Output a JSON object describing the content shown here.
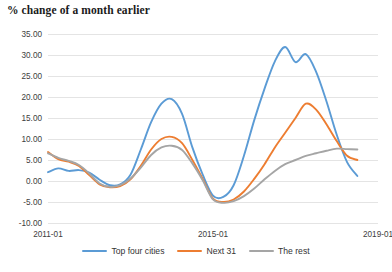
{
  "chart_data": {
    "type": "line",
    "title": "% change of a month earlier",
    "xlabel": "",
    "ylabel": "",
    "grid": true,
    "legend_position": "bottom",
    "ylim": [
      -10,
      35
    ],
    "yticks": [
      35.0,
      30.0,
      25.0,
      20.0,
      15.0,
      10.0,
      5.0,
      0.0,
      -5.0,
      -10.0
    ],
    "ytick_labels": [
      "35.00",
      "30.00",
      "25.00",
      "20.00",
      "15.00",
      "10.00",
      "5.00",
      "0.00",
      "-5.00",
      "-10.00"
    ],
    "xlim": [
      "2011-01",
      "2019-01"
    ],
    "xticks": [
      "2011-01",
      "2015-01",
      "2019-01"
    ],
    "xtick_labels": [
      "2011-01",
      "2015-01",
      "2019-01"
    ],
    "x": [
      "2011-01",
      "2011-04",
      "2011-07",
      "2011-10",
      "2012-01",
      "2012-04",
      "2012-07",
      "2012-10",
      "2013-01",
      "2013-04",
      "2013-07",
      "2013-10",
      "2014-01",
      "2014-04",
      "2014-07",
      "2014-10",
      "2015-01",
      "2015-04",
      "2015-07",
      "2015-10",
      "2016-01",
      "2016-04",
      "2016-07",
      "2016-10",
      "2017-01",
      "2017-04",
      "2017-07",
      "2017-10",
      "2018-01",
      "2018-04",
      "2018-07"
    ],
    "series": [
      {
        "name": "Top four cities",
        "color": "#5B9BD5",
        "values": [
          2.1,
          3.0,
          2.4,
          2.6,
          2.0,
          0.3,
          -1.0,
          -0.8,
          1.5,
          7.5,
          14.0,
          18.4,
          19.5,
          16.0,
          8.0,
          1.5,
          -3.5,
          -3.8,
          -1.0,
          6.0,
          14.5,
          22.0,
          28.5,
          31.9,
          28.3,
          30.2,
          26.0,
          19.0,
          11.0,
          4.5,
          1.2
        ]
      },
      {
        "name": "Next 31",
        "color": "#ED7D31",
        "values": [
          6.9,
          5.2,
          4.6,
          3.6,
          1.4,
          -0.8,
          -1.5,
          -1.2,
          0.4,
          3.6,
          7.5,
          10.0,
          10.5,
          9.0,
          5.0,
          0.5,
          -4.2,
          -5.0,
          -4.4,
          -2.5,
          0.5,
          4.0,
          8.0,
          11.5,
          15.0,
          18.4,
          17.0,
          13.5,
          9.5,
          6.0,
          5.0
        ]
      },
      {
        "name": "The rest",
        "color": "#A5A5A5",
        "values": [
          6.6,
          5.5,
          4.8,
          3.8,
          1.8,
          -0.6,
          -1.4,
          -1.0,
          0.6,
          3.2,
          6.2,
          8.0,
          8.4,
          7.4,
          4.2,
          0.2,
          -4.4,
          -5.2,
          -4.8,
          -3.6,
          -1.8,
          0.4,
          2.4,
          4.0,
          5.0,
          6.0,
          6.6,
          7.2,
          7.7,
          7.6,
          7.5
        ]
      }
    ]
  },
  "legend": {
    "items": [
      {
        "label": "Top four cities",
        "color": "#5B9BD5"
      },
      {
        "label": "Next 31",
        "color": "#ED7D31"
      },
      {
        "label": "The rest",
        "color": "#A5A5A5"
      }
    ]
  }
}
